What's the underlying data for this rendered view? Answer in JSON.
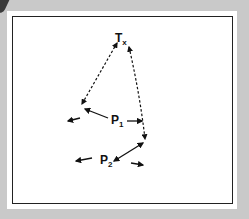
{
  "diagram": {
    "nodes": [
      {
        "id": "tx",
        "label": "T",
        "subscript": "x",
        "x": 120,
        "y": 40
      },
      {
        "id": "p1",
        "label": "P",
        "subscript": "1",
        "x": 115,
        "y": 120
      },
      {
        "id": "p2",
        "label": "P",
        "subscript": "2",
        "x": 105,
        "y": 161
      }
    ],
    "edges": [
      {
        "from": "tx",
        "to": "left-of-p1",
        "style": "dashed",
        "arrows": "both"
      },
      {
        "from": "tx",
        "to": "right-of-p2",
        "style": "dashed",
        "arrows": "both"
      },
      {
        "from": "p1",
        "to": "left-of-p1",
        "style": "solid",
        "arrows": "end"
      },
      {
        "from": "p2",
        "to": "right-of-p2",
        "style": "solid",
        "arrows": "both"
      }
    ],
    "colors": {
      "line": "#111111",
      "background": "#ffffff",
      "outer": "#c9c9c9"
    }
  }
}
